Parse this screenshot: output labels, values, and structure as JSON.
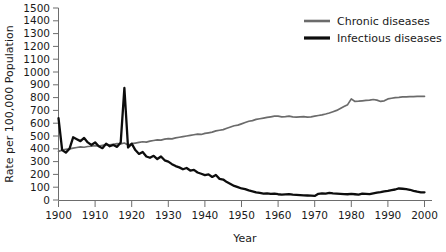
{
  "chart_data": {
    "type": "line",
    "title": "",
    "xlabel": "Year",
    "ylabel": "Rate per 100,000 Population",
    "xlim": [
      1900,
      2000
    ],
    "ylim": [
      0,
      1500
    ],
    "xticks": [
      1900,
      1910,
      1920,
      1930,
      1940,
      1950,
      1960,
      1970,
      1980,
      1990,
      2000
    ],
    "yticks": [
      0,
      100,
      200,
      300,
      400,
      500,
      600,
      700,
      800,
      900,
      1000,
      1100,
      1200,
      1300,
      1400,
      1500
    ],
    "grid": false,
    "legend_position": "top-right",
    "series": [
      {
        "name": "Chronic diseases",
        "color": "#6b6b6b",
        "x": [
          1900,
          1901,
          1902,
          1903,
          1904,
          1905,
          1906,
          1907,
          1908,
          1909,
          1910,
          1911,
          1912,
          1913,
          1914,
          1915,
          1916,
          1917,
          1918,
          1919,
          1920,
          1921,
          1922,
          1923,
          1924,
          1925,
          1926,
          1927,
          1928,
          1929,
          1930,
          1931,
          1932,
          1933,
          1934,
          1935,
          1936,
          1937,
          1938,
          1939,
          1940,
          1941,
          1942,
          1943,
          1944,
          1945,
          1946,
          1947,
          1948,
          1949,
          1950,
          1951,
          1952,
          1953,
          1954,
          1955,
          1956,
          1957,
          1958,
          1959,
          1960,
          1961,
          1962,
          1963,
          1964,
          1965,
          1966,
          1967,
          1968,
          1969,
          1970,
          1971,
          1972,
          1973,
          1974,
          1975,
          1976,
          1977,
          1978,
          1979,
          1980,
          1981,
          1982,
          1983,
          1984,
          1985,
          1986,
          1987,
          1988,
          1989,
          1990,
          1991,
          1992,
          1993,
          1994,
          1995,
          1996,
          1997,
          1998,
          1999,
          2000
        ],
        "values": [
          380,
          390,
          395,
          400,
          405,
          410,
          415,
          412,
          418,
          420,
          425,
          422,
          428,
          432,
          430,
          435,
          440,
          438,
          445,
          430,
          440,
          445,
          450,
          455,
          452,
          460,
          465,
          470,
          468,
          475,
          480,
          478,
          485,
          490,
          495,
          500,
          505,
          510,
          515,
          512,
          520,
          525,
          530,
          540,
          545,
          550,
          560,
          570,
          580,
          585,
          595,
          605,
          615,
          620,
          630,
          635,
          640,
          645,
          650,
          655,
          655,
          650,
          652,
          655,
          650,
          648,
          650,
          652,
          648,
          650,
          655,
          660,
          665,
          672,
          680,
          690,
          700,
          715,
          730,
          745,
          790,
          770,
          772,
          775,
          778,
          780,
          785,
          780,
          770,
          775,
          790,
          795,
          800,
          802,
          805,
          805,
          808,
          808,
          810,
          810,
          810
        ]
      },
      {
        "name": "Infectious diseases",
        "color": "#0d0d0d",
        "x": [
          1900,
          1901,
          1902,
          1903,
          1904,
          1905,
          1906,
          1907,
          1908,
          1909,
          1910,
          1911,
          1912,
          1913,
          1914,
          1915,
          1916,
          1917,
          1918,
          1919,
          1920,
          1921,
          1922,
          1923,
          1924,
          1925,
          1926,
          1927,
          1928,
          1929,
          1930,
          1931,
          1932,
          1933,
          1934,
          1935,
          1936,
          1937,
          1938,
          1939,
          1940,
          1941,
          1942,
          1943,
          1944,
          1945,
          1946,
          1947,
          1948,
          1949,
          1950,
          1951,
          1952,
          1953,
          1954,
          1955,
          1956,
          1957,
          1958,
          1959,
          1960,
          1961,
          1962,
          1963,
          1964,
          1965,
          1966,
          1967,
          1968,
          1969,
          1970,
          1971,
          1972,
          1973,
          1974,
          1975,
          1976,
          1977,
          1978,
          1979,
          1980,
          1981,
          1982,
          1983,
          1984,
          1985,
          1986,
          1987,
          1988,
          1989,
          1990,
          1991,
          1992,
          1993,
          1994,
          1995,
          1996,
          1997,
          1998,
          1999,
          2000
        ],
        "values": [
          640,
          390,
          370,
          400,
          490,
          475,
          460,
          485,
          450,
          430,
          450,
          420,
          405,
          440,
          420,
          430,
          415,
          450,
          875,
          410,
          440,
          390,
          360,
          375,
          340,
          330,
          345,
          320,
          340,
          310,
          300,
          280,
          265,
          255,
          240,
          250,
          230,
          235,
          215,
          205,
          195,
          200,
          180,
          195,
          165,
          160,
          140,
          125,
          110,
          100,
          90,
          85,
          75,
          68,
          60,
          55,
          50,
          52,
          48,
          50,
          45,
          42,
          44,
          46,
          42,
          40,
          38,
          36,
          35,
          34,
          32,
          48,
          52,
          50,
          55,
          52,
          50,
          48,
          46,
          45,
          48,
          45,
          42,
          50,
          48,
          46,
          52,
          58,
          62,
          68,
          72,
          78,
          82,
          90,
          88,
          85,
          80,
          72,
          65,
          60,
          60
        ]
      }
    ],
    "annotations": [
      {
        "label": "1918 influenza pandemic spike",
        "x": 1918,
        "y": 875,
        "series": "Infectious diseases"
      }
    ]
  },
  "legend": {
    "items": [
      {
        "label": "Chronic diseases",
        "color": "#6b6b6b"
      },
      {
        "label": "Infectious diseases",
        "color": "#0d0d0d"
      }
    ]
  },
  "axes": {
    "x_title": "Year",
    "y_title": "Rate per 100,000 Population",
    "x_tick_labels": [
      "1900",
      "1910",
      "1920",
      "1930",
      "1940",
      "1950",
      "1960",
      "1970",
      "1980",
      "1990",
      "2000"
    ],
    "y_tick_labels": [
      "0",
      "100",
      "200",
      "300",
      "400",
      "500",
      "600",
      "700",
      "800",
      "900",
      "1000",
      "1100",
      "1200",
      "1300",
      "1400",
      "1500"
    ]
  }
}
